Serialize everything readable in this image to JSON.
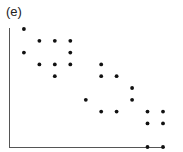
{
  "panel_label": "(e)",
  "chart_data": {
    "type": "scatter",
    "title": "(e)",
    "xlabel": "",
    "ylabel": "",
    "grid": false,
    "axis_ticks": false,
    "xlim": [
      0,
      10
    ],
    "ylim": [
      0,
      10
    ],
    "points": [
      {
        "x": 1,
        "y": 10
      },
      {
        "x": 2,
        "y": 9
      },
      {
        "x": 3,
        "y": 9
      },
      {
        "x": 4,
        "y": 9
      },
      {
        "x": 1,
        "y": 8
      },
      {
        "x": 4,
        "y": 8
      },
      {
        "x": 2,
        "y": 7
      },
      {
        "x": 3,
        "y": 7
      },
      {
        "x": 4,
        "y": 7
      },
      {
        "x": 6,
        "y": 7
      },
      {
        "x": 3,
        "y": 6
      },
      {
        "x": 6,
        "y": 6
      },
      {
        "x": 7,
        "y": 6
      },
      {
        "x": 8,
        "y": 5
      },
      {
        "x": 5,
        "y": 4
      },
      {
        "x": 8,
        "y": 4
      },
      {
        "x": 6,
        "y": 3
      },
      {
        "x": 7,
        "y": 3
      },
      {
        "x": 9,
        "y": 3
      },
      {
        "x": 10,
        "y": 3
      },
      {
        "x": 9,
        "y": 2
      },
      {
        "x": 10,
        "y": 2
      },
      {
        "x": 9,
        "y": 0
      },
      {
        "x": 10,
        "y": 0
      }
    ],
    "pixel_mapping": {
      "x0_px": 8.5,
      "x_step_px": 15.45,
      "y0_px": 147,
      "y_step_px": 11.8
    }
  }
}
